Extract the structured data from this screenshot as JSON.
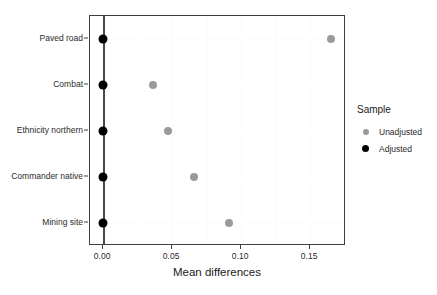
{
  "chart_data": {
    "type": "scatter",
    "title": "",
    "xlabel": "Mean differences",
    "ylabel": "",
    "orientation": "horizontal",
    "categories": [
      "Paved road",
      "Combat",
      "Ethnicity northern",
      "Commander native",
      "Mining site"
    ],
    "series": [
      {
        "name": "Unadjusted",
        "color": "#9a9a9a",
        "values": [
          0.165,
          0.036,
          0.047,
          0.066,
          0.091
        ]
      },
      {
        "name": "Adjusted",
        "color": "#000000",
        "values": [
          0.0,
          0.0,
          0.0,
          0.0,
          0.0
        ]
      }
    ],
    "xlim": [
      -0.0095,
      0.176
    ],
    "xticks": [
      0.0,
      0.05,
      0.1,
      0.15
    ],
    "xtick_labels": [
      "0.00",
      "0.05",
      "0.10",
      "0.15"
    ],
    "grid": true,
    "reference_line_x": 0.0,
    "legend": {
      "title": "Sample",
      "position": "right",
      "entries": [
        {
          "label": "Unadjusted",
          "color": "#9a9a9a"
        },
        {
          "label": "Adjusted",
          "color": "#000000"
        }
      ]
    }
  }
}
